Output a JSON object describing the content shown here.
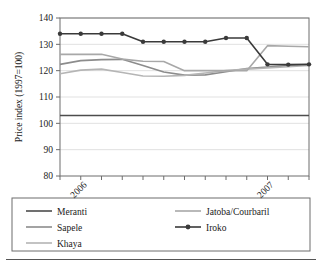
{
  "chart_data": {
    "type": "line",
    "title": "",
    "xlabel": "",
    "ylabel": "Price index (1997=100)",
    "ylim": [
      80,
      140
    ],
    "yticks": [
      80,
      90,
      100,
      110,
      120,
      130,
      140
    ],
    "grid": true,
    "legend_position": "bottom",
    "x": [
      0,
      1,
      2,
      3,
      4,
      5,
      6,
      7,
      8,
      9,
      10,
      11,
      12
    ],
    "xtick_positions": [
      1,
      10
    ],
    "xtick_labels": [
      "2006",
      "2007"
    ],
    "series": [
      {
        "name": "Meranti",
        "color": "#4d4d4d",
        "marker": "none",
        "width": 1.6,
        "values": [
          103,
          103,
          103,
          103,
          103,
          103,
          103,
          103,
          103,
          103,
          103,
          103,
          103
        ]
      },
      {
        "name": "Sapele",
        "color": "#8c8c8c",
        "marker": "none",
        "width": 1.6,
        "values": [
          122.4,
          123.8,
          124.2,
          124.3,
          122.0,
          119.5,
          118.3,
          118.4,
          119.6,
          120.8,
          121.4,
          121.9,
          122.3
        ]
      },
      {
        "name": "Khaya",
        "color": "#b5b5b5",
        "marker": "none",
        "width": 1.6,
        "values": [
          118.8,
          120.2,
          120.6,
          119.3,
          118.0,
          117.9,
          118.2,
          119.1,
          120.0,
          120.6,
          121.0,
          121.5,
          122.0
        ]
      },
      {
        "name": "Jatoba/Courbaril",
        "color": "#a8a8a8",
        "marker": "none",
        "width": 1.6,
        "values": [
          126.2,
          126.2,
          126.2,
          124.4,
          123.6,
          123.5,
          120.0,
          120.0,
          120.0,
          120.0,
          129.5,
          129.3,
          129.1
        ]
      },
      {
        "name": "Iroko",
        "color": "#3a3a3a",
        "marker": "circle",
        "width": 1.6,
        "values": [
          134.0,
          134.0,
          134.0,
          134.0,
          131.0,
          131.0,
          131.0,
          131.0,
          132.4,
          132.4,
          122.4,
          122.3,
          122.4
        ]
      }
    ]
  },
  "legend": {
    "entries": [
      {
        "label": "Meranti"
      },
      {
        "label": "Jatoba/Courbaril"
      },
      {
        "label": "Sapele"
      },
      {
        "label": "Iroko"
      },
      {
        "label": "Khaya"
      }
    ]
  }
}
